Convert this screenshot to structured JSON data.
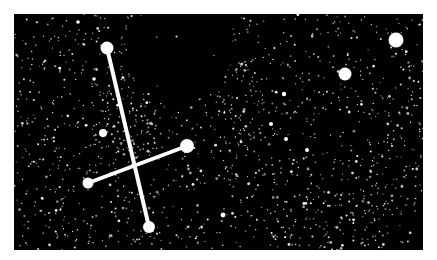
{
  "scene": {
    "background": "#000000",
    "frame": {
      "x": 14,
      "y": 14,
      "width": 409,
      "height": 236
    },
    "star_color": "#ffffff",
    "line_color": "#ffffff",
    "line_width": 4
  },
  "constellation": {
    "stars": [
      {
        "name": "top-star",
        "x": 107,
        "y": 48,
        "r": 6.5
      },
      {
        "name": "bottom-star",
        "x": 149,
        "y": 227,
        "r": 6
      },
      {
        "name": "left-star",
        "x": 88,
        "y": 183,
        "r": 5.5
      },
      {
        "name": "right-star",
        "x": 187,
        "y": 146,
        "r": 7
      },
      {
        "name": "fifth-star",
        "x": 103,
        "y": 133,
        "r": 4
      }
    ],
    "lines": [
      {
        "from": "top-star",
        "to": "bottom-star"
      },
      {
        "from": "left-star",
        "to": "right-star"
      }
    ]
  },
  "bright_stars": [
    {
      "name": "upper-right-star",
      "x": 396,
      "y": 40,
      "r": 7.5
    },
    {
      "name": "middle-right-star",
      "x": 345,
      "y": 74,
      "r": 6.5
    },
    {
      "name": "star-a",
      "x": 284,
      "y": 94,
      "r": 2.2
    },
    {
      "name": "star-b",
      "x": 271,
      "y": 124,
      "r": 2
    },
    {
      "name": "star-c",
      "x": 286,
      "y": 139,
      "r": 2
    },
    {
      "name": "star-d",
      "x": 223,
      "y": 215,
      "r": 2.4
    },
    {
      "name": "star-e",
      "x": 307,
      "y": 150,
      "r": 2
    },
    {
      "name": "star-f",
      "x": 94,
      "y": 79,
      "r": 1.8
    },
    {
      "name": "star-g",
      "x": 78,
      "y": 22,
      "r": 1.8
    }
  ],
  "starfield": {
    "seed": 20240611,
    "count": 1400,
    "dark_regions": [
      {
        "cx": 180,
        "cy": 50,
        "rx": 52,
        "ry": 52,
        "density": 0.04
      },
      {
        "cx": 205,
        "cy": 22,
        "rx": 30,
        "ry": 14,
        "density": 0.0
      },
      {
        "cx": 415,
        "cy": 240,
        "rx": 30,
        "ry": 28,
        "density": 0.15
      }
    ],
    "dense_regions": [
      {
        "cx": 135,
        "cy": 110,
        "rx": 30,
        "ry": 55,
        "boost": 2.2
      },
      {
        "cx": 240,
        "cy": 110,
        "rx": 25,
        "ry": 50,
        "boost": 2.0
      },
      {
        "cx": 330,
        "cy": 220,
        "rx": 70,
        "ry": 30,
        "boost": 2.0
      },
      {
        "cx": 390,
        "cy": 175,
        "rx": 35,
        "ry": 40,
        "boost": 1.6
      }
    ]
  }
}
